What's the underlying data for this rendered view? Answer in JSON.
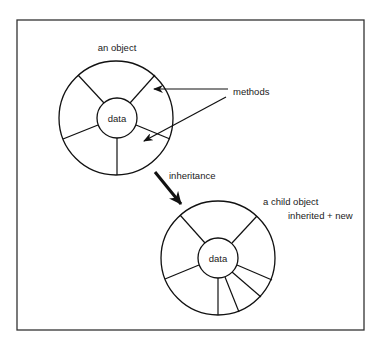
{
  "diagram": {
    "parent": {
      "label": "an object",
      "core_label": "data"
    },
    "methods_label": "methods",
    "inheritance_label": "inheritance",
    "child": {
      "label": "a child object",
      "sublabel": "inherited + new",
      "core_label": "data"
    }
  }
}
